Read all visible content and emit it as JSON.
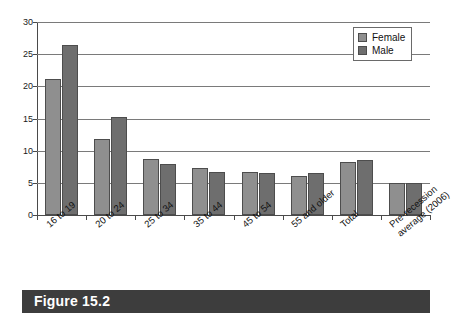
{
  "figure": {
    "caption": "Figure 15.2",
    "caption_bar_color": "#3d3d3d",
    "caption_text_color": "#ffffff"
  },
  "legend": {
    "position": "top-right",
    "entries": [
      {
        "label": "Female",
        "color": "#8f8f8f",
        "swatch_name": "female-swatch"
      },
      {
        "label": "Male",
        "color": "#6e6e6e",
        "swatch_name": "male-swatch"
      }
    ]
  },
  "axis": {
    "y_ticks": [
      "0",
      "5",
      "10",
      "15",
      "20",
      "25",
      "30"
    ]
  },
  "chart_data": {
    "type": "bar",
    "title": "",
    "subtitle": "",
    "xlabel": "",
    "ylabel": "",
    "ylim": [
      0,
      30
    ],
    "ytick_step": 5,
    "grid": true,
    "grid_axis": "y",
    "legend_position": "top-right",
    "categories": [
      "16 to 19",
      "20 to 24",
      "25 to 34",
      "35 to 44",
      "45 to 54",
      "55 and older",
      "Total",
      "Pre-recession average (2006)"
    ],
    "category_lines": [
      [
        "16 to 19"
      ],
      [
        "20 to 24"
      ],
      [
        "25 to 34"
      ],
      [
        "35 to 44"
      ],
      [
        "45 to 54"
      ],
      [
        "55 and older"
      ],
      [
        "Total"
      ],
      [
        "Pre-recession",
        "average (2006)"
      ]
    ],
    "series": [
      {
        "name": "Female",
        "color": "#8f8f8f",
        "values": [
          21.2,
          11.8,
          8.7,
          7.3,
          6.7,
          6.1,
          8.3,
          4.9
        ]
      },
      {
        "name": "Male",
        "color": "#6e6e6e",
        "values": [
          26.4,
          15.2,
          7.9,
          6.7,
          6.5,
          6.6,
          8.6,
          4.9
        ]
      }
    ]
  }
}
